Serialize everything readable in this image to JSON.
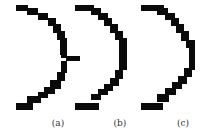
{
  "figure": {
    "ink_color": "#0a0a0a",
    "panels": [
      {
        "id": "a",
        "label": "(a)",
        "label_x": 58,
        "rects": [
          [
            16,
            5,
            12,
            6
          ],
          [
            27,
            8,
            11,
            7
          ],
          [
            38,
            13,
            10,
            7
          ],
          [
            48,
            18,
            8,
            8
          ],
          [
            53,
            24,
            8,
            9
          ],
          [
            57,
            31,
            8,
            9
          ],
          [
            60,
            38,
            7,
            17
          ],
          [
            61,
            53,
            6,
            5
          ],
          [
            66,
            56,
            14,
            5
          ],
          [
            61,
            61,
            6,
            12
          ],
          [
            57,
            72,
            8,
            9
          ],
          [
            50,
            80,
            11,
            9
          ],
          [
            44,
            87,
            11,
            7
          ],
          [
            38,
            92,
            10,
            6
          ],
          [
            27,
            96,
            14,
            7
          ],
          [
            16,
            103,
            17,
            7
          ]
        ]
      },
      {
        "id": "b",
        "label": "(b)",
        "label_x": 120,
        "rects": [
          [
            75,
            5,
            19,
            6
          ],
          [
            91,
            8,
            10,
            7
          ],
          [
            98,
            13,
            10,
            7
          ],
          [
            104,
            18,
            8,
            8
          ],
          [
            110,
            24,
            8,
            9
          ],
          [
            115,
            31,
            8,
            9
          ],
          [
            119,
            38,
            8,
            32
          ],
          [
            115,
            70,
            8,
            9
          ],
          [
            110,
            78,
            9,
            8
          ],
          [
            104,
            84,
            9,
            7
          ],
          [
            98,
            89,
            10,
            6
          ],
          [
            91,
            94,
            10,
            6
          ],
          [
            75,
            103,
            24,
            7
          ]
        ]
      },
      {
        "id": "c",
        "label": "(c)",
        "label_x": 183,
        "rects": [
          [
            141,
            5,
            23,
            6
          ],
          [
            157,
            8,
            11,
            7
          ],
          [
            165,
            13,
            10,
            7
          ],
          [
            171,
            18,
            8,
            8
          ],
          [
            176,
            24,
            8,
            9
          ],
          [
            181,
            31,
            8,
            10
          ],
          [
            186,
            40,
            9,
            8
          ],
          [
            189,
            46,
            6,
            24
          ],
          [
            184,
            68,
            8,
            9
          ],
          [
            178,
            76,
            9,
            8
          ],
          [
            172,
            82,
            10,
            7
          ],
          [
            165,
            88,
            11,
            7
          ],
          [
            157,
            94,
            12,
            8
          ],
          [
            141,
            103,
            22,
            7
          ]
        ]
      }
    ]
  }
}
